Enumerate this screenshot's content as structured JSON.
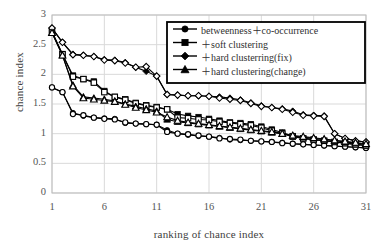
{
  "chart_data": {
    "type": "line",
    "title": "",
    "xlabel": "ranking of chance index",
    "ylabel": "chance index",
    "xlim": [
      1,
      31
    ],
    "ylim": [
      0,
      3
    ],
    "xticks": [
      1,
      6,
      11,
      16,
      21,
      26,
      31
    ],
    "yticks": [
      0,
      0.5,
      1,
      1.5,
      2,
      2.5,
      3
    ],
    "grid": true,
    "legend_position": "top-right",
    "legend_border": true,
    "colors": {
      "line": "#000000",
      "grid": "#d9d9d9",
      "axis": "#bdbdbd",
      "text": "#404040"
    },
    "x": [
      1,
      2,
      3,
      4,
      5,
      6,
      7,
      8,
      9,
      10,
      11,
      12,
      13,
      14,
      15,
      16,
      17,
      18,
      19,
      20,
      21,
      22,
      23,
      24,
      25,
      26,
      27,
      28,
      29,
      30,
      31
    ],
    "series": [
      {
        "name": "betweenness＋co-occurrence",
        "marker": "circle",
        "fill": "filled",
        "values": [
          1.78,
          1.7,
          1.35,
          1.3,
          1.27,
          1.26,
          1.25,
          1.18,
          1.17,
          1.16,
          1.15,
          1.06,
          1.0,
          0.98,
          0.96,
          0.95,
          0.93,
          0.9,
          0.89,
          0.88,
          0.87,
          0.86,
          0.85,
          0.83,
          0.82,
          0.81,
          0.8,
          0.79,
          0.78,
          0.77,
          0.76
        ]
      },
      {
        "name": "betweenness＋co-occurrence (open)",
        "marker": "circle",
        "fill": "open",
        "values": [
          1.78,
          1.7,
          1.33,
          1.31,
          1.27,
          1.25,
          1.24,
          1.19,
          1.17,
          1.16,
          1.15,
          1.03,
          1.0,
          0.99,
          0.97,
          0.95,
          0.92,
          0.91,
          0.9,
          0.88,
          0.87,
          0.86,
          0.84,
          0.83,
          0.82,
          0.81,
          0.8,
          0.79,
          0.78,
          0.77,
          0.76
        ]
      },
      {
        "name": "＋soft clustering",
        "marker": "square",
        "fill": "filled",
        "values": [
          2.72,
          2.34,
          1.98,
          1.92,
          1.88,
          1.72,
          1.62,
          1.58,
          1.52,
          1.48,
          1.45,
          1.41,
          1.33,
          1.3,
          1.28,
          1.25,
          1.22,
          1.19,
          1.18,
          1.16,
          1.12,
          1.07,
          1.02,
          0.96,
          0.92,
          0.9,
          0.88,
          0.86,
          0.84,
          0.82,
          0.8
        ]
      },
      {
        "name": "＋soft clustering (open)",
        "marker": "square",
        "fill": "open",
        "values": [
          2.72,
          2.34,
          1.96,
          1.92,
          1.86,
          1.7,
          1.62,
          1.57,
          1.51,
          1.47,
          1.44,
          1.41,
          1.27,
          1.26,
          1.24,
          1.23,
          1.2,
          1.18,
          1.16,
          1.14,
          1.1,
          1.05,
          1.0,
          0.95,
          0.92,
          0.9,
          0.88,
          0.86,
          0.84,
          0.82,
          0.8
        ]
      },
      {
        "name": "＋hard clusterring(fix)",
        "marker": "diamond",
        "fill": "filled",
        "values": [
          2.78,
          2.54,
          2.34,
          2.32,
          2.3,
          2.25,
          2.24,
          2.2,
          2.12,
          2.05,
          1.97,
          1.66,
          1.65,
          1.64,
          1.64,
          1.63,
          1.62,
          1.6,
          1.57,
          1.52,
          1.47,
          1.44,
          1.42,
          1.38,
          1.32,
          1.31,
          1.3,
          1.0,
          0.92,
          0.88,
          0.86
        ]
      },
      {
        "name": "＋hard clusterring(fix) (open)",
        "marker": "diamond",
        "fill": "open",
        "values": [
          2.78,
          2.54,
          2.33,
          2.32,
          2.3,
          2.24,
          2.23,
          2.19,
          2.12,
          2.13,
          1.97,
          1.66,
          1.65,
          1.64,
          1.64,
          1.63,
          1.6,
          1.58,
          1.56,
          1.51,
          1.46,
          1.44,
          1.41,
          1.36,
          1.31,
          1.3,
          1.29,
          1.0,
          0.92,
          0.88,
          0.86
        ]
      },
      {
        "name": "＋hard clustering(change)",
        "marker": "triangle",
        "fill": "filled",
        "values": [
          2.7,
          2.32,
          1.82,
          1.62,
          1.6,
          1.58,
          1.55,
          1.5,
          1.46,
          1.42,
          1.38,
          1.24,
          1.2,
          1.18,
          1.16,
          1.14,
          1.12,
          1.1,
          1.08,
          1.06,
          1.04,
          1.02,
          1.0,
          0.96,
          0.94,
          0.92,
          0.9,
          0.88,
          0.86,
          0.84,
          0.82
        ]
      },
      {
        "name": "＋hard clustering(change) (open)",
        "marker": "triangle",
        "fill": "open",
        "values": [
          2.7,
          2.32,
          1.8,
          1.6,
          1.58,
          1.56,
          1.54,
          1.49,
          1.44,
          1.4,
          1.36,
          1.28,
          1.22,
          1.19,
          1.17,
          1.15,
          1.13,
          1.11,
          1.09,
          1.07,
          1.05,
          1.03,
          1.0,
          0.97,
          0.95,
          0.93,
          0.91,
          0.89,
          0.87,
          0.85,
          0.83
        ]
      }
    ],
    "legend": [
      {
        "label": "betweenness＋co-occurrence",
        "marker": "circle"
      },
      {
        "label": "＋soft clustering",
        "marker": "square"
      },
      {
        "label": "＋hard clusterring(fix)",
        "marker": "diamond"
      },
      {
        "label": "＋hard clustering(change)",
        "marker": "triangle"
      }
    ]
  }
}
